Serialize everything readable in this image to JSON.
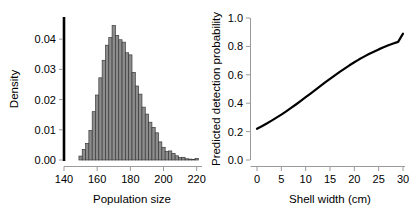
{
  "figure": {
    "panels": [
      "histogram-population-size",
      "line-detection-probability"
    ]
  },
  "chart_data": [
    {
      "type": "bar",
      "panel": "left",
      "title": "",
      "xlabel": "Population size",
      "ylabel": "Density",
      "xlim": [
        140,
        222
      ],
      "ylim": [
        0.0,
        0.047
      ],
      "xticks": [
        140,
        160,
        180,
        200,
        220
      ],
      "xtick_labels": [
        "140",
        "160",
        "180",
        "200",
        "220"
      ],
      "yticks": [
        0.0,
        0.01,
        0.02,
        0.03,
        0.04
      ],
      "ytick_labels": [
        "0.00",
        "0.01",
        "0.02",
        "0.03",
        "0.04"
      ],
      "grid": false,
      "legend": false,
      "bar_fill": "#8c8c8c",
      "bar_edge": "#3a3a3a",
      "bin_width": 2,
      "categories": [
        150,
        152,
        154,
        156,
        158,
        160,
        162,
        164,
        166,
        168,
        170,
        172,
        174,
        176,
        178,
        180,
        182,
        184,
        186,
        188,
        190,
        192,
        194,
        196,
        198,
        200,
        202,
        204,
        206,
        208,
        210,
        212,
        214,
        216,
        218,
        220
      ],
      "values": [
        0.0013,
        0.0035,
        0.0055,
        0.0098,
        0.016,
        0.0215,
        0.0272,
        0.033,
        0.038,
        0.0405,
        0.0445,
        0.0412,
        0.0398,
        0.039,
        0.0355,
        0.0348,
        0.029,
        0.0245,
        0.0218,
        0.0175,
        0.0152,
        0.0125,
        0.0108,
        0.009,
        0.006,
        0.0042,
        0.0028,
        0.003,
        0.0022,
        0.0014,
        0.0008,
        0.0009,
        0.0004,
        0.0003,
        0.0002,
        0.0005
      ]
    },
    {
      "type": "line",
      "panel": "right",
      "title": "",
      "xlabel": "Shell width (cm)",
      "ylabel": "Predicted detection probability",
      "xlim": [
        0,
        30
      ],
      "ylim": [
        0.0,
        1.0
      ],
      "xticks": [
        0,
        5,
        10,
        15,
        20,
        25,
        30
      ],
      "xtick_labels": [
        "0",
        "5",
        "10",
        "15",
        "20",
        "25",
        "30"
      ],
      "yticks": [
        0.0,
        0.2,
        0.4,
        0.6,
        0.8,
        1.0
      ],
      "ytick_labels": [
        "0.0",
        "0.2",
        "0.4",
        "0.6",
        "0.8",
        "1.0"
      ],
      "grid": false,
      "legend": false,
      "line_color": "#000000",
      "line_width": 2.2,
      "x": [
        0,
        1,
        2,
        3,
        4,
        5,
        6,
        7,
        8,
        9,
        10,
        11,
        12,
        13,
        14,
        15,
        16,
        17,
        18,
        19,
        20,
        21,
        22,
        23,
        24,
        25,
        26,
        27,
        28,
        29,
        30
      ],
      "y": [
        0.22,
        0.238,
        0.257,
        0.277,
        0.298,
        0.32,
        0.343,
        0.367,
        0.391,
        0.416,
        0.442,
        0.468,
        0.494,
        0.52,
        0.546,
        0.571,
        0.596,
        0.621,
        0.644,
        0.667,
        0.688,
        0.709,
        0.728,
        0.746,
        0.763,
        0.779,
        0.794,
        0.808,
        0.82,
        0.832,
        0.89
      ]
    }
  ]
}
